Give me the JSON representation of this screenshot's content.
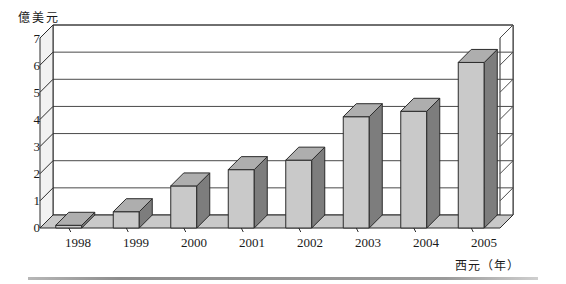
{
  "chart_data": {
    "type": "bar",
    "title": "",
    "subtitle": "",
    "xlabel": "西元（年）",
    "ylabel": "億美元",
    "categories": [
      "1998",
      "1999",
      "2000",
      "2001",
      "2002",
      "2003",
      "2004",
      "2005"
    ],
    "values": [
      0.1,
      0.6,
      1.55,
      2.15,
      2.5,
      4.1,
      4.3,
      6.1
    ],
    "series": [
      {
        "name": "金額",
        "values": [
          0.1,
          0.6,
          1.55,
          2.15,
          2.5,
          4.1,
          4.3,
          6.1
        ]
      }
    ],
    "ylim": [
      0,
      7
    ],
    "ytick_labels": [
      "0",
      "1",
      "2",
      "3",
      "4",
      "5",
      "6",
      "7"
    ],
    "ytick_values": [
      0,
      1,
      2,
      3,
      4,
      5,
      6,
      7
    ],
    "grid": true,
    "grid_axis": "y",
    "legend": false,
    "legend_position": "none",
    "style": "3d-column",
    "colors": {
      "bar_front": "#c9c9c9",
      "bar_top": "#aeaeae",
      "bar_side": "#7d7d7d",
      "bar_outline": "#2b2b2b",
      "grid_line": "#4a4a4a",
      "wall": "#ffffff",
      "floor": "#c9c9c9",
      "axis_line": "#2b2b2b",
      "text": "#1a1a1a",
      "bottom_rule": "#9a9a9a"
    }
  },
  "axis": {
    "y_title": "億美元",
    "x_title": "西元（年）"
  },
  "yticks": [
    {
      "label": "7"
    },
    {
      "label": "6"
    },
    {
      "label": "5"
    },
    {
      "label": "4"
    },
    {
      "label": "3"
    },
    {
      "label": "2"
    },
    {
      "label": "1"
    },
    {
      "label": "0"
    }
  ],
  "xticks": [
    {
      "label": "1998"
    },
    {
      "label": "1999"
    },
    {
      "label": "2000"
    },
    {
      "label": "2001"
    },
    {
      "label": "2002"
    },
    {
      "label": "2003"
    },
    {
      "label": "2004"
    },
    {
      "label": "2005"
    }
  ]
}
